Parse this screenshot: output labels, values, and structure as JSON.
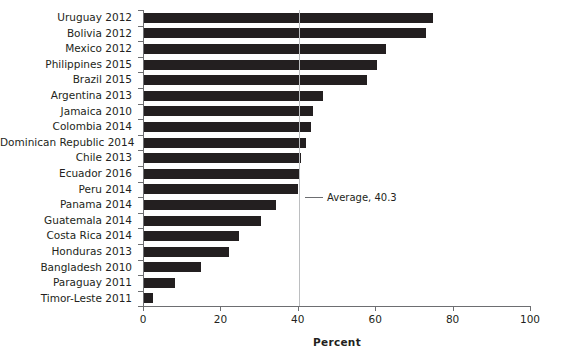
{
  "chart_data": {
    "type": "bar",
    "orientation": "horizontal",
    "title": "",
    "xlabel": "Percent",
    "ylabel": "",
    "xlim": [
      0,
      100
    ],
    "grid": false,
    "legend": null,
    "categories": [
      "Uruguay 2012",
      "Bolivia 2012",
      "Mexico 2012",
      "Philippines 2015",
      "Brazil 2015",
      "Argentina 2013",
      "Jamaica 2010",
      "Colombia 2014",
      "Dominican Republic 2014",
      "Chile 2013",
      "Ecuador 2016",
      "Peru 2014",
      "Panama 2014",
      "Guatemala 2014",
      "Costa Rica 2014",
      "Honduras 2013",
      "Bangladesh 2010",
      "Paraguay 2011",
      "Timor-Leste 2011"
    ],
    "values": [
      74.7,
      72.9,
      62.5,
      60.2,
      57.6,
      46.3,
      43.7,
      43.2,
      41.9,
      40.6,
      40.3,
      39.8,
      34.1,
      30.2,
      24.5,
      22.0,
      14.7,
      8.0,
      2.3
    ],
    "xticks": [
      0,
      20,
      40,
      60,
      80,
      100
    ],
    "xticklabels": [
      "0",
      "20",
      "40",
      "60",
      "80",
      "100"
    ],
    "annotations": [
      {
        "name": "average-reference-line",
        "label": "Average, 40.3",
        "value": 40.3
      }
    ],
    "colors": {
      "bar": "#231f20",
      "axis": "#6d6e71",
      "average_line": "#bcbec0",
      "background": "#ffffff",
      "text": "#231f20"
    }
  }
}
